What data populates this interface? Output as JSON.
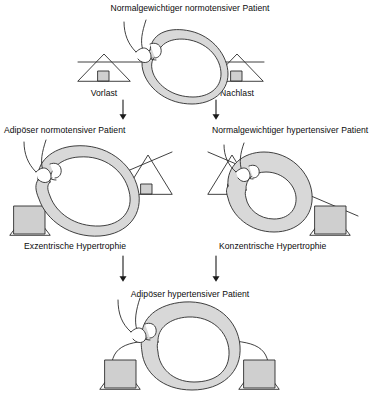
{
  "diagram": {
    "type": "medical-flow-diagram",
    "language": "de",
    "colors": {
      "stroke": "#2b2b2b",
      "wall_fill": "#d6d6d6",
      "weight_fill": "#cccccc",
      "background": "#ffffff"
    }
  },
  "panels": {
    "top": {
      "title": "Normalgewichtiger normotensiver Patient",
      "left_load_label": "Vorlast",
      "right_load_label": "Nachlast",
      "beam_state": "level",
      "heart_state": "normal",
      "left_weight": "small",
      "right_weight": "small"
    },
    "middle_left": {
      "title": "Adipöser normotensiver Patient",
      "caption": "Exzentrische Hypertrophie",
      "beam_state": "tilted-left",
      "heart_state": "dilated",
      "left_weight": "large",
      "right_weight": "small"
    },
    "middle_right": {
      "title": "Normalgewichtiger hypertensiver Patient",
      "caption": "Konzentrische Hypertrophie",
      "beam_state": "tilted-right",
      "heart_state": "thick-walled",
      "left_weight": "small",
      "right_weight": "large"
    },
    "bottom": {
      "title": "Adipöser hypertensiver Patient",
      "beam_state": "bowed",
      "heart_state": "dilated-and-thick",
      "left_weight": "large",
      "right_weight": "large"
    }
  },
  "arrows": {
    "top_to_middle_left": "down-arrow",
    "top_to_middle_right": "down-arrow",
    "middle_left_to_bottom": "down-arrow",
    "middle_right_to_bottom": "down-arrow"
  }
}
